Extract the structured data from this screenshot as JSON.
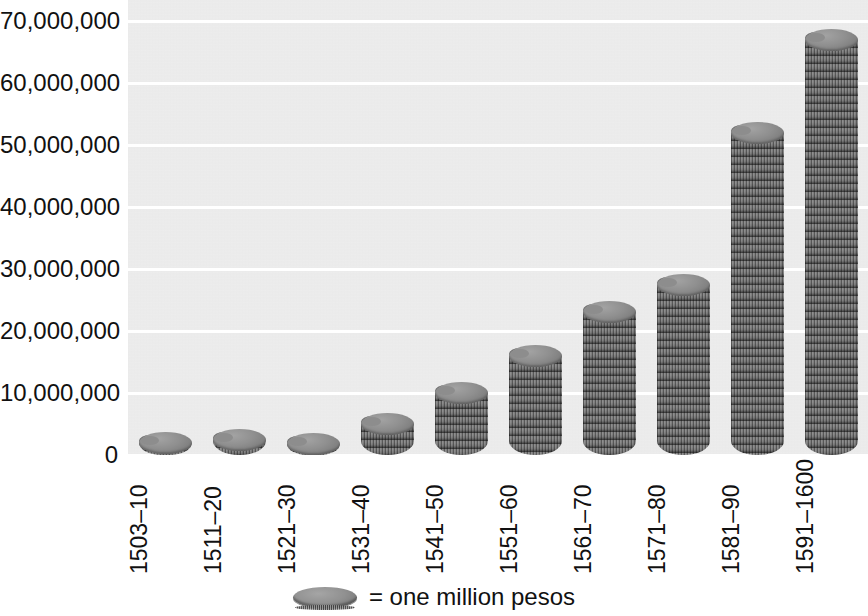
{
  "chart_data": {
    "type": "bar",
    "title": "",
    "subtitle": "",
    "xlabel": "",
    "ylabel": "",
    "ylim": [
      0,
      70000000
    ],
    "ytick_step": 10000000,
    "grid": true,
    "legend_position": "bottom-center",
    "unit_note": "= one million pesos",
    "categories": [
      "1503–10",
      "1511–20",
      "1521–30",
      "1531–40",
      "1541–50",
      "1551–60",
      "1561–70",
      "1571–80",
      "1581–90",
      "1591–1600"
    ],
    "values": [
      2000000,
      2500000,
      1800000,
      5000000,
      10000000,
      16000000,
      23000000,
      27500000,
      52000000,
      67000000
    ],
    "ytick_labels": [
      "70,000,000",
      "60,000,000",
      "50,000,000",
      "40,000,000",
      "30,000,000",
      "20,000,000",
      "10,000,000",
      "0"
    ],
    "ytick_values": [
      70000000,
      60000000,
      50000000,
      40000000,
      30000000,
      20000000,
      10000000,
      0
    ]
  },
  "legend": {
    "symbol": "coin-icon",
    "label": "= one million pesos"
  },
  "colors": {
    "plot_background": "#ebebeb",
    "gridline": "#ffffff",
    "coin_fill": "#8d8d8d",
    "coin_edge": "#3f3f3f",
    "text": "#111111",
    "page_background": "#ffffff"
  }
}
